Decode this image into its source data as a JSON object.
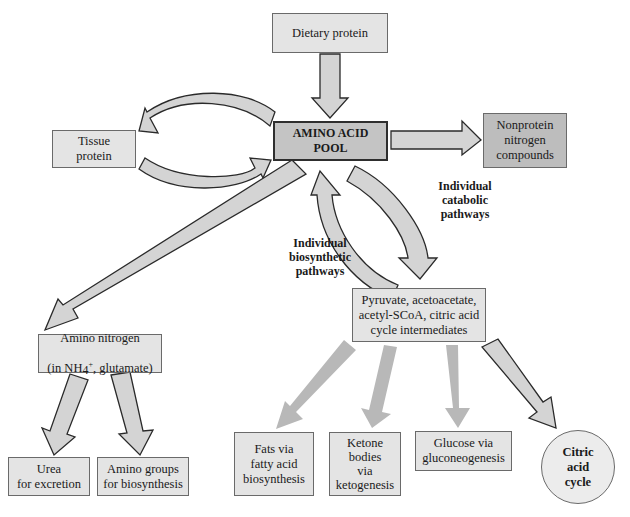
{
  "diagram": {
    "nodes": {
      "dietary_protein": "Dietary protein",
      "amino_acid_pool": "AMINO ACID\nPOOL",
      "nonprotein_nitrogen": "Nonprotein\nnitrogen\ncompounds",
      "tissue_protein": "Tissue\nprotein",
      "amino_nitrogen_line1": "Amino nitrogen",
      "amino_nitrogen_line2_pre": "(in NH",
      "amino_nitrogen_sub": "4",
      "amino_nitrogen_sup": "+",
      "amino_nitrogen_line2_post": ", glutamate)",
      "urea": "Urea\nfor excretion",
      "amino_groups": "Amino groups\nfor biosynthesis",
      "pyruvate": "Pyruvate, acetoacetate,\nacetyl-SCoA, citric acid\ncycle intermediates",
      "fats": "Fats via\nfatty acid\nbiosynthesis",
      "ketone": "Ketone\nbodies\nvia\nketogenesis",
      "glucose": "Glucose via\ngluconeogenesis",
      "citric_acid_cycle": "Citric\nacid\ncycle"
    },
    "labels": {
      "catabolic": "Individual\ncatabolic\npathways",
      "biosynthetic": "Individual\nbiosynthetic\npathways"
    },
    "edges": [
      {
        "from": "Dietary protein",
        "to": "AMINO ACID POOL"
      },
      {
        "from": "AMINO ACID POOL",
        "to": "Nonprotein nitrogen compounds"
      },
      {
        "from": "AMINO ACID POOL",
        "to": "Tissue protein"
      },
      {
        "from": "Tissue protein",
        "to": "AMINO ACID POOL"
      },
      {
        "from": "AMINO ACID POOL",
        "to": "Amino nitrogen (in NH4+, glutamate)"
      },
      {
        "from": "AMINO ACID POOL",
        "to": "Pyruvate, acetoacetate, acetyl-SCoA, citric acid cycle intermediates",
        "label": "Individual catabolic pathways"
      },
      {
        "from": "Pyruvate, acetoacetate, acetyl-SCoA, citric acid cycle intermediates",
        "to": "AMINO ACID POOL",
        "label": "Individual biosynthetic pathways"
      },
      {
        "from": "Amino nitrogen (in NH4+, glutamate)",
        "to": "Urea for excretion"
      },
      {
        "from": "Amino nitrogen (in NH4+, glutamate)",
        "to": "Amino groups for biosynthesis"
      },
      {
        "from": "Pyruvate, acetoacetate, acetyl-SCoA, citric acid cycle intermediates",
        "to": "Fats via fatty acid biosynthesis"
      },
      {
        "from": "Pyruvate, acetoacetate, acetyl-SCoA, citric acid cycle intermediates",
        "to": "Ketone bodies via ketogenesis"
      },
      {
        "from": "Pyruvate, acetoacetate, acetyl-SCoA, citric acid cycle intermediates",
        "to": "Glucose via gluconeogenesis"
      },
      {
        "from": "Pyruvate, acetoacetate, acetyl-SCoA, citric acid cycle intermediates",
        "to": "Citric acid cycle"
      }
    ]
  },
  "colors": {
    "box_fill": "#e4e4e4",
    "box_dark_fill": "#bdbdbd",
    "arrow_fill": "#d4d4d4",
    "arrow_faded_fill": "#b8b8b8",
    "stroke": "#2a2a2a"
  }
}
